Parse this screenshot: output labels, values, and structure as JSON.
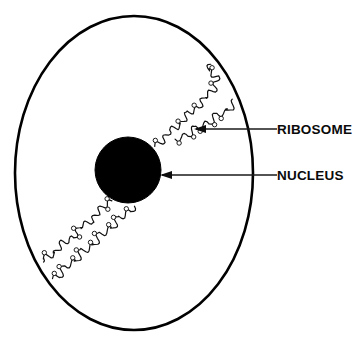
{
  "figure": {
    "background_color": "#ffffff",
    "ink_color": "#000000",
    "width": 364,
    "height": 344
  },
  "structures": {
    "cell_membrane": {
      "name": "cell membrane",
      "shape": "ellipse",
      "center_x": 134,
      "center_y": 173,
      "radius_x": 119,
      "radius_y": 157,
      "fill": "none",
      "stroke": "#000000",
      "stroke_width": 2.6
    },
    "nucleus": {
      "name": "nucleus",
      "shape": "circle",
      "center_x": 128,
      "center_y": 170,
      "radius": 33,
      "fill": "#000000",
      "stroke": "#000000"
    },
    "endoplasmic_reticulum": {
      "name": "rough endoplasmic reticulum",
      "description": "wavy membrane chains studded with ribosome granules running diagonally from lower-left to upper-right across the cytoplasm",
      "stroke": "#111111",
      "stroke_width": 1.2,
      "ribosome_radius": 2.2,
      "segment_count": 4
    }
  },
  "labels": [
    {
      "id": "ribosome",
      "text": "RIBOSOME",
      "text_x": 277,
      "text_y": 134,
      "leader_x_start": 277,
      "leader_x_end": 196,
      "leader_y": 129,
      "arrow_direction": "left"
    },
    {
      "id": "nucleus",
      "text": "NUCLEUS",
      "text_x": 277,
      "text_y": 180,
      "leader_x_start": 277,
      "leader_x_end": 162,
      "leader_y": 175,
      "arrow_direction": "left"
    }
  ]
}
